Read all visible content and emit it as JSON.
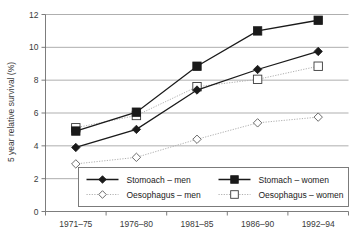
{
  "chart_data": {
    "type": "line",
    "title": "",
    "xlabel": "",
    "ylabel": "5 year relative survival (%)",
    "categories": [
      "1971–75",
      "1976–80",
      "1981–85",
      "1986–90",
      "1992–94"
    ],
    "ylim": [
      0,
      12
    ],
    "yticks": [
      0,
      2,
      4,
      6,
      8,
      10,
      12
    ],
    "ytick_labels": [
      "0",
      "2",
      "4",
      "6",
      "8",
      "10",
      "12"
    ],
    "grid": "horizontal",
    "legend_position": "inside-bottom-center",
    "series": [
      {
        "name": "Stomoach – men",
        "values": [
          3.9,
          5.0,
          7.4,
          8.65,
          9.75
        ],
        "marker": "filled-diamond",
        "line_style": "solid",
        "color": "#1a1a1a"
      },
      {
        "name": "Stomach – women",
        "values": [
          4.9,
          6.05,
          8.85,
          11.0,
          11.65
        ],
        "marker": "filled-square",
        "line_style": "solid",
        "color": "#1a1a1a"
      },
      {
        "name": "Oesophagus – men",
        "values": [
          2.9,
          3.3,
          4.4,
          5.4,
          5.75
        ],
        "marker": "open-diamond",
        "line_style": "dotted",
        "color": "#b0b0b0"
      },
      {
        "name": "Oesophagus – women",
        "values": [
          5.1,
          5.85,
          7.6,
          8.05,
          8.85
        ],
        "marker": "open-square",
        "line_style": "dotted",
        "color": "#b0b0b0"
      }
    ]
  },
  "axes": {
    "y_title": "5 year relative survival (%)"
  },
  "legend": {
    "entries": [
      {
        "label": "Stomoach – men"
      },
      {
        "label": "Stomach – women"
      },
      {
        "label": "Oesophagus – men"
      },
      {
        "label": "Oesophagus – women"
      }
    ]
  },
  "colors": {
    "solid_series": "#1a1a1a",
    "dotted_series": "#b0b0b0",
    "gridline": "#8c8c8c",
    "axis": "#6e6e6e",
    "text": "#3a3a3a",
    "background": "#ffffff"
  }
}
